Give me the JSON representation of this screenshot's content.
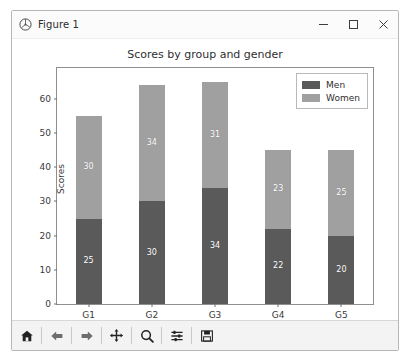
{
  "window": {
    "title": "Figure 1",
    "icon": "matplotlib-icon",
    "minimize_label": "Minimize",
    "maximize_label": "Maximize",
    "close_label": "Close"
  },
  "toolbar": {
    "buttons": [
      {
        "name": "home-icon",
        "label": "Reset original view"
      },
      {
        "name": "back-arrow-icon",
        "label": "Back to previous view"
      },
      {
        "name": "forward-arrow-icon",
        "label": "Forward to next view"
      },
      {
        "name": "pan-move-icon",
        "label": "Pan axes with left mouse, zoom with right"
      },
      {
        "name": "zoom-magnifier-icon",
        "label": "Zoom to rectangle"
      },
      {
        "name": "configure-subplots-icon",
        "label": "Configure subplots"
      },
      {
        "name": "save-floppy-icon",
        "label": "Save the figure"
      }
    ]
  },
  "colors": {
    "men": "#5a5a5a",
    "women": "#a0a0a0",
    "axes_edge": "#8f8f8f",
    "text": "#3a3a3a",
    "figure_background": "#ffffff"
  },
  "chart_data": {
    "type": "bar",
    "bar_mode": "stacked",
    "title": "Scores by group and gender",
    "xlabel": "",
    "ylabel": "Scores",
    "categories": [
      "G1",
      "G2",
      "G3",
      "G4",
      "G5"
    ],
    "series": [
      {
        "name": "Men",
        "values": [
          25,
          30,
          34,
          22,
          20
        ],
        "color": "#5a5a5a"
      },
      {
        "name": "Women",
        "values": [
          30,
          34,
          31,
          23,
          25
        ],
        "color": "#a0a0a0"
      }
    ],
    "totals": [
      55,
      64,
      65,
      45,
      45
    ],
    "ylim": [
      0,
      69
    ],
    "yticks": [
      0,
      10,
      20,
      30,
      40,
      50,
      60
    ],
    "ytick_labels": [
      "0",
      "10",
      "20",
      "30",
      "40",
      "50",
      "60"
    ],
    "grid": false,
    "legend_position": "upper right",
    "legend_entries": [
      "Men",
      "Women"
    ],
    "bar_labels_shown": true
  }
}
